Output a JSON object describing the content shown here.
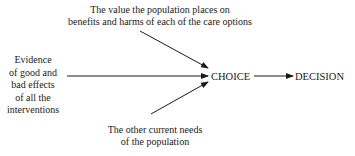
{
  "diagram": {
    "top_input": {
      "lines": [
        "The value the population places on",
        "benefits and harms of each of the care options"
      ]
    },
    "left_input": {
      "lines": [
        "Evidence",
        "of good and",
        "bad effects",
        "of all the",
        "interventions"
      ]
    },
    "bottom_input": {
      "lines": [
        "The other current needs",
        "of the population"
      ]
    },
    "center_node": "CHOICE",
    "output_node": "DECISION",
    "edges": [
      {
        "from": "top_input",
        "to": "CHOICE"
      },
      {
        "from": "left_input",
        "to": "CHOICE"
      },
      {
        "from": "bottom_input",
        "to": "CHOICE"
      },
      {
        "from": "CHOICE",
        "to": "DECISION"
      }
    ],
    "colors": {
      "line": "#1a1a1a",
      "background": "#ffffff"
    }
  }
}
